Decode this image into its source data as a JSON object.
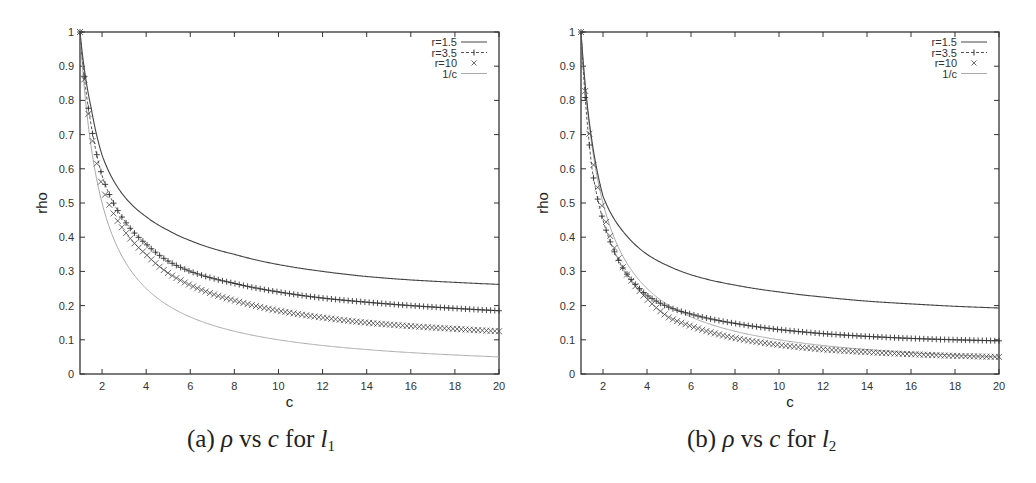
{
  "chart_data": [
    {
      "type": "line",
      "title": "",
      "caption": {
        "prefix": "(a)",
        "rho": "ρ",
        "vs": "vs",
        "c": "c",
        "for": "for",
        "l": "l",
        "sub": "1"
      },
      "xlabel": "c",
      "ylabel": "rho",
      "xlim": [
        1,
        20
      ],
      "ylim": [
        0,
        1
      ],
      "xticks": [
        2,
        4,
        6,
        8,
        10,
        12,
        14,
        16,
        18,
        20
      ],
      "yticks": [
        "0",
        "0.1",
        "0.2",
        "0.3",
        "0.4",
        "0.5",
        "0.6",
        "0.7",
        "0.8",
        "0.9",
        "1"
      ],
      "legend_position": "top-right",
      "grid": false,
      "x": [
        1,
        1.5,
        2,
        3,
        4,
        5,
        6,
        8,
        10,
        12,
        14,
        16,
        18,
        20
      ],
      "series": [
        {
          "name": "r=1.5",
          "style": "solid",
          "values": [
            1,
            0.78,
            0.64,
            0.52,
            0.46,
            0.42,
            0.39,
            0.35,
            0.32,
            0.3,
            0.285,
            0.275,
            0.268,
            0.262
          ]
        },
        {
          "name": "r=3.5",
          "style": "dashed-plus",
          "values": [
            1,
            0.73,
            0.58,
            0.45,
            0.38,
            0.33,
            0.3,
            0.265,
            0.24,
            0.222,
            0.21,
            0.2,
            0.192,
            0.185
          ]
        },
        {
          "name": "r=10",
          "style": "cross",
          "values": [
            1,
            0.71,
            0.55,
            0.42,
            0.35,
            0.295,
            0.26,
            0.215,
            0.185,
            0.165,
            0.15,
            0.14,
            0.132,
            0.125
          ]
        },
        {
          "name": "1/c",
          "style": "light",
          "values": [
            1,
            0.667,
            0.5,
            0.333,
            0.25,
            0.2,
            0.167,
            0.125,
            0.1,
            0.083,
            0.071,
            0.0625,
            0.056,
            0.05
          ]
        }
      ]
    },
    {
      "type": "line",
      "title": "",
      "caption": {
        "prefix": "(b)",
        "rho": "ρ",
        "vs": "vs",
        "c": "c",
        "for": "for",
        "l": "l",
        "sub": "2"
      },
      "xlabel": "c",
      "ylabel": "rho",
      "xlim": [
        1,
        20
      ],
      "ylim": [
        0,
        1
      ],
      "xticks": [
        2,
        4,
        6,
        8,
        10,
        12,
        14,
        16,
        18,
        20
      ],
      "yticks": [
        "0",
        "0.1",
        "0.2",
        "0.3",
        "0.4",
        "0.5",
        "0.6",
        "0.7",
        "0.8",
        "0.9",
        "1"
      ],
      "legend_position": "top-right",
      "grid": false,
      "x": [
        1,
        1.5,
        2,
        3,
        4,
        5,
        6,
        8,
        10,
        12,
        14,
        16,
        18,
        20
      ],
      "series": [
        {
          "name": "r=1.5",
          "style": "solid",
          "values": [
            1,
            0.68,
            0.52,
            0.41,
            0.35,
            0.315,
            0.29,
            0.26,
            0.24,
            0.225,
            0.213,
            0.205,
            0.198,
            0.193
          ]
        },
        {
          "name": "r=3.5",
          "style": "dashed-plus",
          "values": [
            1,
            0.6,
            0.45,
            0.3,
            0.23,
            0.195,
            0.175,
            0.148,
            0.13,
            0.118,
            0.11,
            0.104,
            0.1,
            0.097
          ]
        },
        {
          "name": "r=10",
          "style": "cross",
          "values": [
            1,
            0.64,
            0.48,
            0.3,
            0.22,
            0.165,
            0.14,
            0.105,
            0.085,
            0.072,
            0.064,
            0.058,
            0.053,
            0.05
          ]
        },
        {
          "name": "1/c",
          "style": "light",
          "values": [
            1,
            0.667,
            0.5,
            0.333,
            0.25,
            0.2,
            0.167,
            0.125,
            0.1,
            0.083,
            0.071,
            0.0625,
            0.056,
            0.05
          ]
        }
      ]
    }
  ]
}
